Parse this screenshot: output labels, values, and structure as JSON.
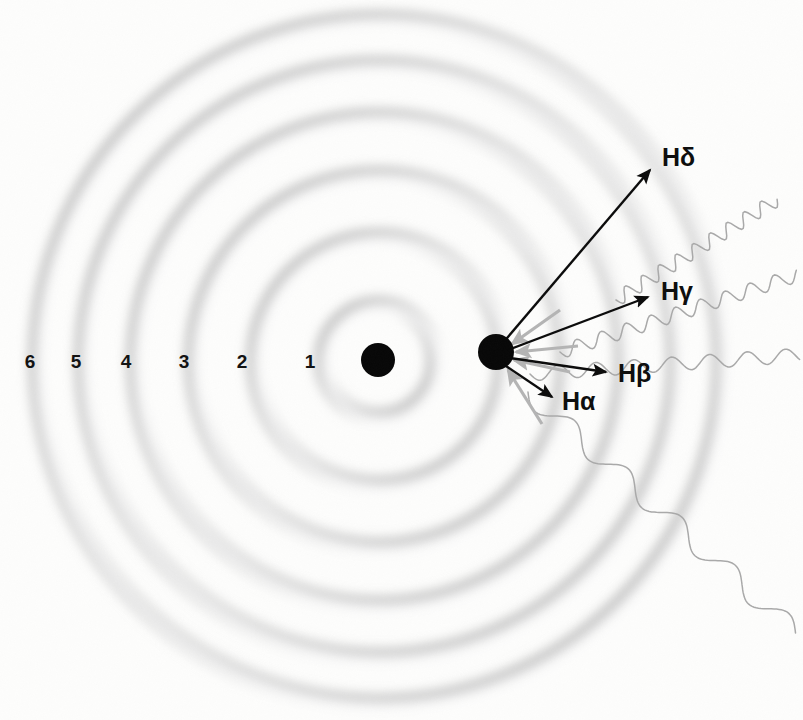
{
  "diagram": {
    "background_color": "#fdfdfc",
    "nucleus": {
      "name": "nucleus",
      "cx": 378,
      "cy": 360,
      "r": 17,
      "color": "#070707"
    },
    "electron": {
      "name": "electron",
      "cx": 496,
      "cy": 352,
      "r": 18,
      "color": "#070707"
    },
    "orbits": [
      {
        "label": "1",
        "radius": 56,
        "label_x": 310,
        "label_y": 368
      },
      {
        "label": "2",
        "radius": 124,
        "label_x": 242,
        "label_y": 368
      },
      {
        "label": "3",
        "radius": 186,
        "label_x": 184,
        "label_y": 368
      },
      {
        "label": "4",
        "radius": 244,
        "label_x": 126,
        "label_y": 368
      },
      {
        "label": "5",
        "radius": 296,
        "label_x": 76,
        "label_y": 368
      },
      {
        "label": "6",
        "radius": 342,
        "label_x": 30,
        "label_y": 368
      }
    ],
    "orbit_ring_color": "#b9b9b9",
    "transitions": [
      {
        "label": "Hδ",
        "name": "h-delta",
        "arrow_from_x": 502,
        "arrow_from_y": 344,
        "arrow_to_x": 650,
        "arrow_to_y": 170,
        "label_x": 662,
        "label_y": 166,
        "color": "#0b0b0b"
      },
      {
        "label": "Hγ",
        "name": "h-gamma",
        "arrow_from_x": 508,
        "arrow_from_y": 350,
        "arrow_to_x": 648,
        "arrow_to_y": 297,
        "label_x": 661,
        "label_y": 300,
        "color": "#0b0b0b"
      },
      {
        "label": "Hβ",
        "name": "h-beta",
        "arrow_from_x": 510,
        "arrow_from_y": 358,
        "arrow_to_x": 606,
        "arrow_to_y": 372,
        "label_x": 618,
        "label_y": 382,
        "color": "#0b0b0b"
      },
      {
        "label": "Hα",
        "name": "h-alpha",
        "arrow_from_x": 506,
        "arrow_from_y": 366,
        "arrow_to_x": 552,
        "arrow_to_y": 397,
        "label_x": 562,
        "label_y": 410,
        "color": "#0b0b0b"
      }
    ],
    "absorption_arrows": [
      {
        "name": "absorb-arrow-1",
        "from_x": 560,
        "from_y": 310,
        "to_x": 512,
        "to_y": 344
      },
      {
        "name": "absorb-arrow-2",
        "from_x": 578,
        "from_y": 346,
        "to_x": 516,
        "to_y": 352
      },
      {
        "name": "absorb-arrow-3",
        "from_x": 570,
        "from_y": 372,
        "to_x": 514,
        "to_y": 360
      },
      {
        "name": "absorb-arrow-4",
        "from_x": 542,
        "from_y": 424,
        "to_x": 508,
        "to_y": 370
      }
    ],
    "photon_waves": [
      {
        "name": "photon-wave-h-delta",
        "amplitude": 7,
        "wavelength": 20,
        "angle_deg": -32,
        "start_x": 616,
        "start_y": 300,
        "length": 190
      },
      {
        "name": "photon-wave-h-gamma",
        "amplitude": 7,
        "wavelength": 26,
        "angle_deg": -18,
        "start_x": 560,
        "start_y": 352,
        "length": 250
      },
      {
        "name": "photon-wave-h-beta",
        "amplitude": 7,
        "wavelength": 38,
        "angle_deg": -4,
        "start_x": 530,
        "start_y": 374,
        "length": 270
      },
      {
        "name": "photon-wave-h-alpha",
        "amplitude": 10,
        "wavelength": 72,
        "angle_deg": 42,
        "start_x": 528,
        "start_y": 392,
        "length": 360
      }
    ],
    "caption": ""
  }
}
